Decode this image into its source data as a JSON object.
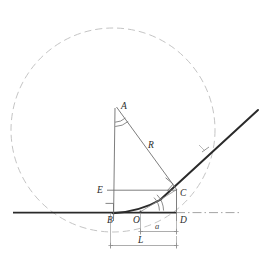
{
  "figure": {
    "background": "#ffffff",
    "width": 269,
    "height": 262
  },
  "colors": {
    "circle_stroke": "#b9b9b9",
    "thin_line": "#6f6f6f",
    "thick_line": "#2a2a2a",
    "dim_line": "#8a8a8a",
    "label_text": "#2b2b2b",
    "dash_dot": "#9a9a9a"
  },
  "points": {
    "A": {
      "label": "A",
      "x": 117,
      "y": 104,
      "label_x": 121,
      "label_y": 108
    },
    "B": {
      "label": "B",
      "x": 113,
      "y": 212,
      "label_x": 108,
      "label_y": 222
    },
    "C": {
      "label": "C",
      "x": 176,
      "y": 189,
      "label_x": 180,
      "label_y": 195
    },
    "D": {
      "label": "D",
      "x": 176,
      "y": 212,
      "label_x": 180,
      "label_y": 222
    },
    "E": {
      "label": "E",
      "x": 113,
      "y": 190,
      "label_x": 100,
      "label_y": 193
    },
    "O": {
      "label": "O",
      "x": 140,
      "y": 212,
      "label_x": 135,
      "label_y": 222
    }
  },
  "segments": {
    "radius_label": {
      "label": "R",
      "x": 151,
      "y": 146
    },
    "dimension_a": {
      "label": "a",
      "x": 155,
      "y": 236,
      "from": "O",
      "to": "D"
    },
    "dimension_L": {
      "label": "L",
      "x": 139,
      "y": 251,
      "from": "B",
      "to": "D"
    },
    "incline_tick": {
      "label": "",
      "x": 205,
      "y": 150
    }
  },
  "circle": {
    "center_x": 113,
    "center_y": 130,
    "radius": 102,
    "style": "dashed",
    "tangent_point": "B"
  },
  "ground_line": {
    "solid_from_x": 13,
    "solid_to_x": 176,
    "dash_dot_to_x": 241,
    "y": 212
  },
  "incline_line": {
    "from_x": 113,
    "from_y": 213,
    "to_x": 258,
    "to_y": 110,
    "tangent_at": "C"
  },
  "angle_marks": [
    {
      "name": "angle-at-A",
      "vertex": "A",
      "arcs": 2
    },
    {
      "name": "angle-at-O",
      "vertex": "O",
      "arcs": 2
    }
  ],
  "right_angles": [
    {
      "name": "right-angle-at-B",
      "vertex": "B"
    },
    {
      "name": "right-angle-at-C",
      "vertex": "C"
    }
  ]
}
